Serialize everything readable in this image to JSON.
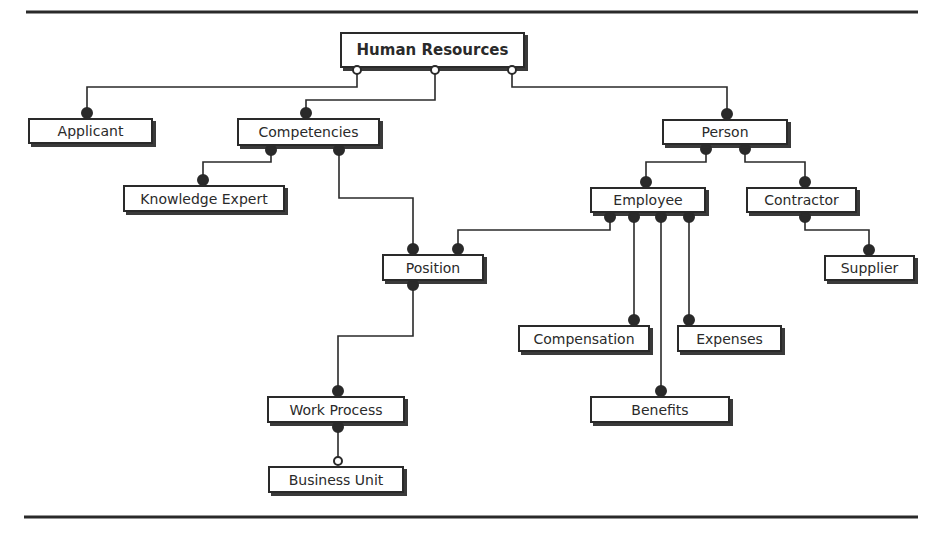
{
  "diagram": {
    "type": "entity-relationship",
    "nodes": [
      {
        "id": "hr",
        "label": "Human Resources",
        "x": 340,
        "y": 32,
        "w": 185,
        "h": 36,
        "root": true
      },
      {
        "id": "applicant",
        "label": "Applicant",
        "x": 28,
        "y": 118,
        "w": 125,
        "h": 26
      },
      {
        "id": "competencies",
        "label": "Competencies",
        "x": 237,
        "y": 118,
        "w": 143,
        "h": 28
      },
      {
        "id": "person",
        "label": "Person",
        "x": 662,
        "y": 119,
        "w": 126,
        "h": 26
      },
      {
        "id": "knowledge-expert",
        "label": "Knowledge Expert",
        "x": 123,
        "y": 185,
        "w": 162,
        "h": 27
      },
      {
        "id": "employee",
        "label": "Employee",
        "x": 590,
        "y": 187,
        "w": 116,
        "h": 26
      },
      {
        "id": "contractor",
        "label": "Contractor",
        "x": 746,
        "y": 187,
        "w": 111,
        "h": 26
      },
      {
        "id": "position",
        "label": "Position",
        "x": 382,
        "y": 254,
        "w": 102,
        "h": 27
      },
      {
        "id": "supplier",
        "label": "Supplier",
        "x": 824,
        "y": 255,
        "w": 91,
        "h": 26
      },
      {
        "id": "compensation",
        "label": "Compensation",
        "x": 518,
        "y": 325,
        "w": 132,
        "h": 27
      },
      {
        "id": "expenses",
        "label": "Expenses",
        "x": 677,
        "y": 325,
        "w": 105,
        "h": 27
      },
      {
        "id": "work-process",
        "label": "Work Process",
        "x": 267,
        "y": 396,
        "w": 138,
        "h": 27
      },
      {
        "id": "benefits",
        "label": "Benefits",
        "x": 590,
        "y": 396,
        "w": 140,
        "h": 27
      },
      {
        "id": "business-unit",
        "label": "Business Unit",
        "x": 268,
        "y": 466,
        "w": 136,
        "h": 27
      }
    ],
    "edges": [
      {
        "from": "hr",
        "to": "applicant",
        "path": [
          [
            357,
            70
          ],
          [
            357,
            87
          ],
          [
            87,
            87
          ],
          [
            87,
            113
          ]
        ],
        "start": "open",
        "end": "filled"
      },
      {
        "from": "hr",
        "to": "competencies",
        "path": [
          [
            435,
            70
          ],
          [
            435,
            100
          ],
          [
            306,
            100
          ],
          [
            306,
            113
          ]
        ],
        "start": "open",
        "end": "filled"
      },
      {
        "from": "hr",
        "to": "person",
        "path": [
          [
            512,
            70
          ],
          [
            512,
            87
          ],
          [
            727,
            87
          ],
          [
            727,
            114
          ]
        ],
        "start": "open",
        "end": "filled"
      },
      {
        "from": "competencies",
        "to": "knowledge-expert",
        "path": [
          [
            271,
            150
          ],
          [
            271,
            162
          ],
          [
            203,
            162
          ],
          [
            203,
            180
          ]
        ],
        "start": "filled",
        "end": "filled"
      },
      {
        "from": "competencies",
        "to": "position",
        "path": [
          [
            339,
            150
          ],
          [
            339,
            198
          ],
          [
            413,
            198
          ],
          [
            413,
            249
          ]
        ],
        "start": "filled",
        "end": "filled"
      },
      {
        "from": "person",
        "to": "employee",
        "path": [
          [
            706,
            149
          ],
          [
            706,
            162
          ],
          [
            646,
            162
          ],
          [
            646,
            182
          ]
        ],
        "start": "filled",
        "end": "filled"
      },
      {
        "from": "person",
        "to": "contractor",
        "path": [
          [
            745,
            149
          ],
          [
            745,
            162
          ],
          [
            805,
            162
          ],
          [
            805,
            182
          ]
        ],
        "start": "filled",
        "end": "filled"
      },
      {
        "from": "employee",
        "to": "position",
        "path": [
          [
            610,
            217
          ],
          [
            610,
            230
          ],
          [
            458,
            230
          ],
          [
            458,
            249
          ]
        ],
        "start": "filled",
        "end": "filled"
      },
      {
        "from": "employee",
        "to": "compensation",
        "path": [
          [
            634,
            217
          ],
          [
            634,
            320
          ]
        ],
        "start": "filled",
        "end": "filled"
      },
      {
        "from": "employee",
        "to": "benefits",
        "path": [
          [
            661,
            217
          ],
          [
            661,
            391
          ]
        ],
        "start": "filled",
        "end": "filled"
      },
      {
        "from": "employee",
        "to": "expenses",
        "path": [
          [
            689,
            217
          ],
          [
            689,
            320
          ]
        ],
        "start": "filled",
        "end": "filled"
      },
      {
        "from": "contractor",
        "to": "supplier",
        "path": [
          [
            805,
            217
          ],
          [
            805,
            230
          ],
          [
            869,
            230
          ],
          [
            869,
            250
          ]
        ],
        "start": "filled",
        "end": "filled"
      },
      {
        "from": "position",
        "to": "work-process",
        "path": [
          [
            413,
            285
          ],
          [
            413,
            336
          ],
          [
            338,
            336
          ],
          [
            338,
            391
          ]
        ],
        "start": "filled",
        "end": "filled"
      },
      {
        "from": "work-process",
        "to": "business-unit",
        "path": [
          [
            338,
            427
          ],
          [
            338,
            461
          ]
        ],
        "start": "filled",
        "end": "open"
      }
    ],
    "rules": [
      {
        "x1": 26,
        "y1": 12,
        "x2": 918,
        "y2": 12
      },
      {
        "x1": 24,
        "y1": 517,
        "x2": 918,
        "y2": 517
      }
    ],
    "colors": {
      "stroke": "#2a2a2a",
      "fill": "#ffffff"
    }
  }
}
